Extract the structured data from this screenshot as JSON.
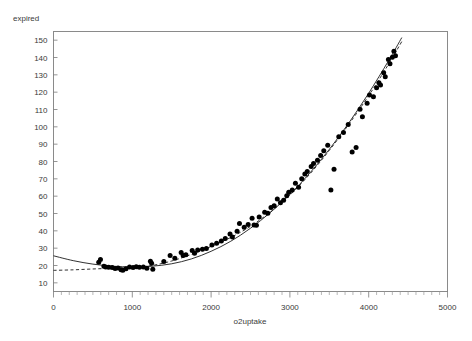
{
  "chart_data": {
    "type": "scatter",
    "title": "",
    "xlabel": "o2uptake",
    "ylabel": "expired",
    "xlim": [
      0,
      5000
    ],
    "ylim": [
      5,
      155
    ],
    "grid": false,
    "legend": "none",
    "x_ticks": [
      0,
      1000,
      2000,
      3000,
      4000,
      5000
    ],
    "x_tick_labels": [
      "0",
      "1000",
      "2000",
      "3000",
      "4000",
      "5000"
    ],
    "x_minor_tick_step": 100,
    "y_ticks": [
      10,
      20,
      30,
      40,
      50,
      60,
      70,
      80,
      90,
      100,
      110,
      120,
      130,
      140,
      150
    ],
    "y_tick_labels": [
      "10",
      "20",
      "30",
      "40",
      "50",
      "60",
      "70",
      "80",
      "90",
      "100",
      "110",
      "120",
      "130",
      "140",
      "150"
    ],
    "points": [
      [
        574,
        21.9
      ],
      [
        596,
        23.5
      ],
      [
        640,
        19.6
      ],
      [
        663,
        19.1
      ],
      [
        700,
        19.0
      ],
      [
        745,
        18.9
      ],
      [
        782,
        18.2
      ],
      [
        820,
        18.6
      ],
      [
        857,
        17.6
      ],
      [
        880,
        17.3
      ],
      [
        920,
        18.1
      ],
      [
        965,
        19.1
      ],
      [
        1010,
        18.8
      ],
      [
        1050,
        19.3
      ],
      [
        1090,
        19.0
      ],
      [
        1140,
        19.2
      ],
      [
        1185,
        18.4
      ],
      [
        1230,
        22.4
      ],
      [
        1245,
        21.3
      ],
      [
        1260,
        17.8
      ],
      [
        1400,
        22.3
      ],
      [
        1480,
        25.7
      ],
      [
        1540,
        24.2
      ],
      [
        1620,
        27.5
      ],
      [
        1645,
        25.8
      ],
      [
        1680,
        26.2
      ],
      [
        1760,
        28.6
      ],
      [
        1790,
        27.0
      ],
      [
        1830,
        28.9
      ],
      [
        1890,
        29.4
      ],
      [
        1940,
        29.8
      ],
      [
        2010,
        31.8
      ],
      [
        2070,
        32.9
      ],
      [
        2130,
        34.1
      ],
      [
        2180,
        35.6
      ],
      [
        2240,
        38.2
      ],
      [
        2270,
        36.4
      ],
      [
        2330,
        39.8
      ],
      [
        2360,
        44.3
      ],
      [
        2420,
        42.1
      ],
      [
        2470,
        43.7
      ],
      [
        2520,
        47.2
      ],
      [
        2545,
        43.3
      ],
      [
        2575,
        43.2
      ],
      [
        2610,
        48.0
      ],
      [
        2680,
        50.7
      ],
      [
        2720,
        50.1
      ],
      [
        2760,
        53.5
      ],
      [
        2800,
        54.5
      ],
      [
        2840,
        58.3
      ],
      [
        2880,
        56.2
      ],
      [
        2920,
        57.6
      ],
      [
        2960,
        60.3
      ],
      [
        2985,
        62.2
      ],
      [
        3030,
        63.5
      ],
      [
        3070,
        67.4
      ],
      [
        3110,
        65.2
      ],
      [
        3150,
        70.1
      ],
      [
        3190,
        72.8
      ],
      [
        3220,
        74.3
      ],
      [
        3270,
        77.1
      ],
      [
        3300,
        78.8
      ],
      [
        3350,
        80.7
      ],
      [
        3390,
        83.4
      ],
      [
        3430,
        86.2
      ],
      [
        3480,
        89.4
      ],
      [
        3520,
        63.6
      ],
      [
        3560,
        75.5
      ],
      [
        3620,
        94.3
      ],
      [
        3680,
        96.7
      ],
      [
        3740,
        101.4
      ],
      [
        3790,
        85.5
      ],
      [
        3840,
        88.1
      ],
      [
        3890,
        110.2
      ],
      [
        3920,
        105.8
      ],
      [
        3980,
        113.6
      ],
      [
        4010,
        118.3
      ],
      [
        4060,
        117.4
      ],
      [
        4100,
        122.6
      ],
      [
        4130,
        125.5
      ],
      [
        4150,
        124.1
      ],
      [
        4190,
        131.2
      ],
      [
        4210,
        128.9
      ],
      [
        4250,
        138.8
      ],
      [
        4270,
        136.4
      ],
      [
        4300,
        140.2
      ],
      [
        4320,
        143.6
      ],
      [
        4340,
        141.0
      ]
    ],
    "fits": [
      {
        "name": "quadratic-fit",
        "style": "solid",
        "x_range": [
          0,
          4420
        ],
        "y_at": [
          [
            0,
            25.6
          ],
          [
            250,
            22.8
          ],
          [
            500,
            20.8
          ],
          [
            750,
            19.6
          ],
          [
            1000,
            19.2
          ],
          [
            1250,
            19.6
          ],
          [
            1500,
            21.0
          ],
          [
            1750,
            23.8
          ],
          [
            2000,
            28.2
          ],
          [
            2250,
            34.0
          ],
          [
            2500,
            41.5
          ],
          [
            2750,
            50.5
          ],
          [
            3000,
            61.0
          ],
          [
            3250,
            73.2
          ],
          [
            3500,
            87.0
          ],
          [
            3750,
            102.4
          ],
          [
            4000,
            119.4
          ],
          [
            4250,
            138.0
          ],
          [
            4420,
            151.5
          ]
        ]
      },
      {
        "name": "spline-fit",
        "style": "dashed",
        "x_range": [
          0,
          4430
        ],
        "y_at": [
          [
            0,
            17.2
          ],
          [
            250,
            17.5
          ],
          [
            500,
            18.0
          ],
          [
            750,
            18.4
          ],
          [
            1000,
            18.8
          ],
          [
            1250,
            20.0
          ],
          [
            1500,
            22.6
          ],
          [
            1750,
            26.4
          ],
          [
            2000,
            31.0
          ],
          [
            2250,
            36.2
          ],
          [
            2500,
            42.6
          ],
          [
            2750,
            50.8
          ],
          [
            3000,
            60.6
          ],
          [
            3250,
            72.6
          ],
          [
            3500,
            86.4
          ],
          [
            3750,
            101.6
          ],
          [
            4000,
            118.0
          ],
          [
            4250,
            136.0
          ],
          [
            4430,
            150.0
          ]
        ]
      }
    ]
  },
  "axes": {
    "y_title": "expired",
    "x_title": "o2uptake"
  }
}
